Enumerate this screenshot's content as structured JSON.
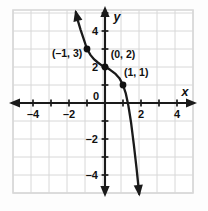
{
  "figure": {
    "background_color": "#fdfdfd",
    "grid_color": "#d8d8d8",
    "axis_color": "#1a1a1a",
    "curve_color": "#1a1a1a",
    "point_color": "#111111",
    "label_color": "#111111"
  },
  "axes": {
    "x_axis_name": "x",
    "y_axis_name": "y",
    "x_tick_labels": [
      "–4",
      "–2",
      "0",
      "2",
      "4"
    ],
    "x_tick_values": [
      -4,
      -2,
      0,
      2,
      4
    ],
    "y_tick_labels": [
      "4",
      "2",
      "–2",
      "–4"
    ],
    "y_tick_values": [
      4,
      2,
      -2,
      -4
    ],
    "origin_label": "0"
  },
  "chart_data": {
    "type": "line",
    "title": "",
    "xlabel": "x",
    "ylabel": "y",
    "xlim": [
      -5.1,
      4.9
    ],
    "ylim": [
      -5.2,
      4.8
    ],
    "grid": true,
    "grid_step": 1,
    "legend": "none",
    "annotations": [
      {
        "text": "(–1, 3)",
        "point": [
          -1,
          3
        ],
        "label_at": [
          -2.95,
          2.55
        ]
      },
      {
        "text": "(0, 2)",
        "point": [
          0,
          2
        ],
        "label_at": [
          0.32,
          2.5
        ]
      },
      {
        "text": "(1, 1)",
        "point": [
          1,
          1
        ],
        "label_at": [
          1.05,
          1.5
        ]
      }
    ],
    "marked_points": [
      {
        "x": -1,
        "y": 3
      },
      {
        "x": 0,
        "y": 2
      },
      {
        "x": 1,
        "y": 1
      }
    ],
    "series": [
      {
        "name": "curve",
        "arrow_start": true,
        "arrow_end": true,
        "x": [
          -1.62,
          -1.5,
          -1.35,
          -1.2,
          -1.0,
          -0.8,
          -0.6,
          -0.4,
          -0.2,
          0.0,
          0.2,
          0.4,
          0.6,
          0.8,
          1.0,
          1.15,
          1.3,
          1.45,
          1.6,
          1.75,
          1.9
        ],
        "y": [
          5.05,
          4.55,
          4.05,
          3.6,
          3.0,
          2.66,
          2.42,
          2.25,
          2.1,
          2.0,
          1.9,
          1.76,
          1.6,
          1.38,
          1.0,
          0.55,
          -0.15,
          -1.1,
          -2.3,
          -3.6,
          -5.05
        ]
      }
    ]
  }
}
